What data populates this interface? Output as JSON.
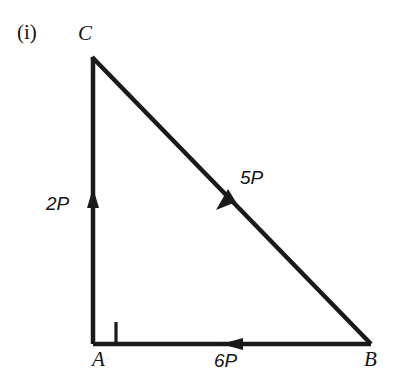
{
  "figure": {
    "part_label": "(i)",
    "background_color": "#ffffff",
    "stroke_color": "#1a1a1a",
    "vertices": [
      {
        "name": "C",
        "label": "C",
        "x": 92,
        "y": 57
      },
      {
        "name": "A",
        "label": "A",
        "x": 92,
        "y": 344
      },
      {
        "name": "B",
        "label": "B",
        "x": 370,
        "y": 344
      }
    ],
    "right_angle": {
      "at": "A",
      "size": 23,
      "marker": "square"
    },
    "edges": [
      {
        "name": "edge-ca",
        "from": "C",
        "to": "A",
        "force_label": "2P",
        "arrow_direction": "up",
        "arrow_x": 93,
        "arrow_y": 200
      },
      {
        "name": "edge-cb",
        "from": "C",
        "to": "B",
        "force_label": "5P",
        "arrow_direction": "down-left",
        "arrow_x": 227,
        "arrow_y": 199
      },
      {
        "name": "edge-ab",
        "from": "A",
        "to": "B",
        "force_label": "6P",
        "arrow_direction": "left",
        "arrow_x": 233,
        "arrow_y": 344
      }
    ]
  }
}
